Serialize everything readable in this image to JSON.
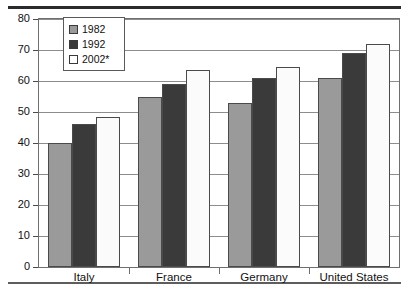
{
  "chart_data": {
    "type": "bar",
    "title": "",
    "subtitle": "",
    "xlabel": "",
    "ylabel": "",
    "ylim": [
      0,
      80
    ],
    "yticks": [
      0,
      10,
      20,
      30,
      40,
      50,
      60,
      70,
      80
    ],
    "ytick_labels": [
      "0",
      "10",
      "20",
      "30",
      "40",
      "50",
      "60",
      "70",
      "80"
    ],
    "grid": true,
    "legend_position": "upper-left-inside",
    "categories": [
      "Italy",
      "France",
      "Germany",
      "United States"
    ],
    "series": [
      {
        "name": "1982",
        "color": "#9a9a9a",
        "values": [
          40,
          55,
          53,
          61
        ]
      },
      {
        "name": "1992",
        "color": "#3a3a3a",
        "values": [
          46,
          59,
          61,
          69
        ]
      },
      {
        "name": "2002*",
        "color": "#ffffff",
        "values": [
          48.5,
          63.5,
          64.5,
          72
        ]
      }
    ],
    "annotations": []
  },
  "legend": {
    "items": [
      {
        "label": "1982",
        "swatch": "swatch-1982"
      },
      {
        "label": "1992",
        "swatch": "swatch-1992"
      },
      {
        "label": "2002*",
        "swatch": "swatch-2002"
      }
    ]
  }
}
